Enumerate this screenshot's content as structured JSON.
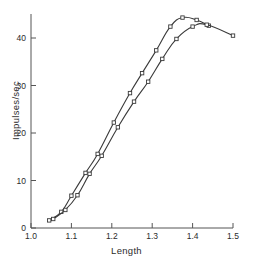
{
  "chart_data": {
    "type": "line",
    "title": "",
    "subtitle": "",
    "xlabel": "Length",
    "ylabel": "Impulses/sec",
    "xlim": [
      1.0,
      1.5
    ],
    "ylim": [
      0,
      45
    ],
    "xticks": [
      "1.0",
      "1.1",
      "1.2",
      "1.3",
      "1.4",
      "1.5"
    ],
    "xtick_values": [
      1.0,
      1.1,
      1.2,
      1.3,
      1.4,
      1.5
    ],
    "yticks": [
      "0",
      "10",
      "20",
      "30",
      "40"
    ],
    "ytick_values": [
      0,
      10,
      20,
      30,
      40
    ],
    "grid": false,
    "legend": "none",
    "marker": "open-square",
    "line_color": "#3a3a3a",
    "marker_color": "#3a3a3a",
    "series": [
      {
        "name": "curve-1",
        "x": [
          1.045,
          1.075,
          1.1,
          1.135,
          1.165,
          1.205,
          1.245,
          1.275,
          1.31,
          1.345,
          1.375,
          1.41,
          1.44
        ],
        "values": [
          1.6,
          3.4,
          6.8,
          11.6,
          15.6,
          22.2,
          28.4,
          32.6,
          37.4,
          42.4,
          44.3,
          43.8,
          42.6
        ]
      },
      {
        "name": "curve-2",
        "x": [
          1.055,
          1.085,
          1.115,
          1.145,
          1.175,
          1.215,
          1.255,
          1.29,
          1.325,
          1.36,
          1.4,
          1.435,
          1.5
        ],
        "values": [
          1.9,
          3.8,
          6.9,
          11.4,
          15.2,
          21.2,
          26.6,
          30.8,
          35.6,
          39.8,
          42.4,
          42.8,
          40.5
        ]
      }
    ]
  },
  "axes": {
    "x_axis_name": "length-axis",
    "y_axis_name": "impulses-axis"
  }
}
